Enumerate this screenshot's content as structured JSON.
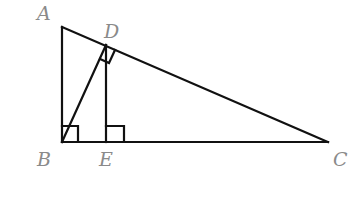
{
  "diagram": {
    "type": "geometry",
    "stroke_color": "#111111",
    "label_color": "#8a8a8a",
    "points": {
      "A": {
        "label": "A",
        "x": 62,
        "y": 27
      },
      "B": {
        "label": "B",
        "x": 62,
        "y": 142
      },
      "C": {
        "label": "C",
        "x": 328,
        "y": 142
      },
      "D": {
        "label": "D",
        "x": 106,
        "y": 45
      },
      "E": {
        "label": "E",
        "x": 106,
        "y": 142
      }
    },
    "segments": [
      "AB",
      "BC",
      "AC",
      "BD",
      "DE"
    ],
    "right_angles": [
      "ABC",
      "BDC",
      "DEB"
    ]
  }
}
